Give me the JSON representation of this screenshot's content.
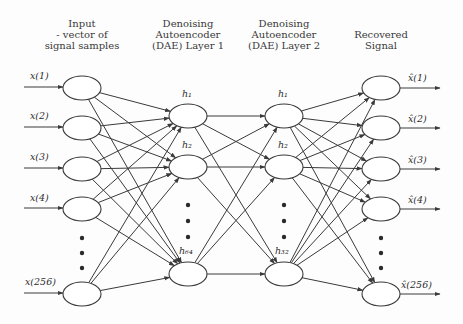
{
  "headers": {
    "input": [
      "Input",
      "- vector of",
      "signal samples"
    ],
    "dae1": [
      "Denoising",
      "Autoencoder",
      "(DAE) Layer 1"
    ],
    "dae2": [
      "Denoising",
      "Autoencoder",
      "(DAE) Layer 2"
    ],
    "output": [
      "Recovered",
      "Signal"
    ]
  },
  "layers": {
    "input": {
      "labels": [
        "x(1)",
        "x(2)",
        "x(3)",
        "x(4)",
        "x(256)"
      ],
      "size": 256
    },
    "dae1": {
      "labels": [
        "h₁",
        "h₂",
        "h₆₄"
      ],
      "size": 64
    },
    "dae2": {
      "labels": [
        "h₁",
        "h₂",
        "h₃₂"
      ],
      "size": 32
    },
    "output": {
      "labels": [
        "x̂(1)",
        "x̂(2)",
        "x̂(3)",
        "x̂(4)",
        "x̂(256)"
      ],
      "size": 256
    }
  },
  "colors": {
    "stroke": "#3a3a3a",
    "node_fill": "#ffffff",
    "background": "#fdfdfd"
  }
}
